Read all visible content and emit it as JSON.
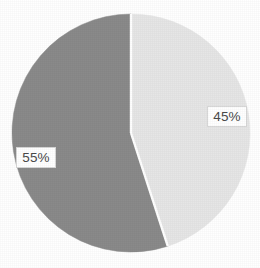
{
  "chart_data": {
    "type": "pie",
    "title": "",
    "subtitle": "",
    "xlabel": "",
    "ylabel": "",
    "grid": false,
    "legend_position": "none",
    "labels_inside": true,
    "start_angle_deg": 0,
    "direction": "clockwise",
    "categories": [
      "45%",
      "55%"
    ],
    "values": [
      45,
      55
    ],
    "slices": [
      {
        "label": "45%",
        "value": 45,
        "color": "#e6e6e6",
        "start_angle_deg": 0,
        "end_angle_deg": 162,
        "label_x": 227,
        "label_y": 116
      },
      {
        "label": "55%",
        "value": 55,
        "color": "#8a8a8a",
        "start_angle_deg": 162,
        "end_angle_deg": 360,
        "label_x": 36,
        "label_y": 157
      }
    ],
    "geometry": {
      "center_x": 131,
      "center_y": 133,
      "radius": 119
    },
    "colors": {
      "background": "#ffffff",
      "slice_light": "#e6e6e6",
      "slice_dark": "#8a8a8a",
      "label_text": "#4a4a4a",
      "label_box": "#ffffff",
      "label_border": "#d8d8d8",
      "divider": "#ffffff"
    }
  }
}
